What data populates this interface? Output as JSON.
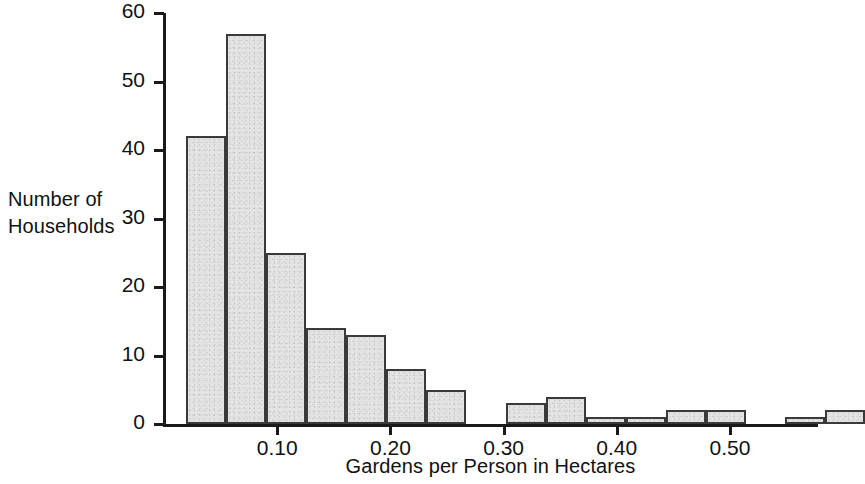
{
  "chart_data": {
    "type": "bar",
    "title": "",
    "subtitle": "",
    "xlabel": "Gardens per Person in Hectares",
    "ylabel": "Number of\nHouseholds",
    "ylabel_lines": [
      "Number of",
      "Households"
    ],
    "ylim": [
      0,
      60
    ],
    "xlim": [
      0.0,
      0.58
    ],
    "grid": false,
    "legend": null,
    "ytick_labels": [
      "0",
      "10",
      "20",
      "30",
      "40",
      "50",
      "60"
    ],
    "ytick_values": [
      0,
      10,
      20,
      30,
      40,
      50,
      60
    ],
    "xtick_labels": [
      "0.10",
      "0.20",
      "0.30",
      "0.40",
      "0.50"
    ],
    "xtick_values": [
      0.1,
      0.2,
      0.3,
      0.4,
      0.5
    ],
    "bin_width": 0.0353,
    "bin_start": 0.0195,
    "bars": [
      {
        "bin_left": 0.0195,
        "bin_right": 0.0548,
        "value": 42
      },
      {
        "bin_left": 0.0548,
        "bin_right": 0.0901,
        "value": 57
      },
      {
        "bin_left": 0.0901,
        "bin_right": 0.1254,
        "value": 25
      },
      {
        "bin_left": 0.1254,
        "bin_right": 0.1607,
        "value": 14
      },
      {
        "bin_left": 0.1607,
        "bin_right": 0.196,
        "value": 13
      },
      {
        "bin_left": 0.196,
        "bin_right": 0.2313,
        "value": 8
      },
      {
        "bin_left": 0.2313,
        "bin_right": 0.2666,
        "value": 5
      },
      {
        "bin_left": 0.2666,
        "bin_right": 0.3019,
        "value": 0
      },
      {
        "bin_left": 0.3019,
        "bin_right": 0.3372,
        "value": 3
      },
      {
        "bin_left": 0.3372,
        "bin_right": 0.3725,
        "value": 4
      },
      {
        "bin_left": 0.3725,
        "bin_right": 0.4078,
        "value": 1
      },
      {
        "bin_left": 0.4078,
        "bin_right": 0.4431,
        "value": 1
      },
      {
        "bin_left": 0.4431,
        "bin_right": 0.4784,
        "value": 2
      },
      {
        "bin_left": 0.4784,
        "bin_right": 0.5137,
        "value": 2
      },
      {
        "bin_left": 0.5137,
        "bin_right": 0.549,
        "value": 0
      },
      {
        "bin_left": 0.549,
        "bin_right": 0.5843,
        "value": 1
      },
      {
        "bin_left": 0.5843,
        "bin_right": 0.6196,
        "value": 2
      }
    ],
    "values": [
      42,
      57,
      25,
      14,
      13,
      8,
      5,
      0,
      3,
      4,
      1,
      1,
      2,
      2,
      0,
      1,
      2
    ],
    "colors": {
      "bar_fill": "#e3e3e3",
      "bar_edge": "#3a3a3a",
      "axis": "#1a1a1a",
      "text": "#111111",
      "background": "#ffffff"
    }
  },
  "plot_geometry": {
    "axis_left_x": 163,
    "axis_baseline_y": 424,
    "axis_top_y": 13,
    "axis_right_x": 818,
    "px_per_unit_y": 6.85,
    "x_origin_px": 164,
    "px_per_x_unit": 1132
  }
}
